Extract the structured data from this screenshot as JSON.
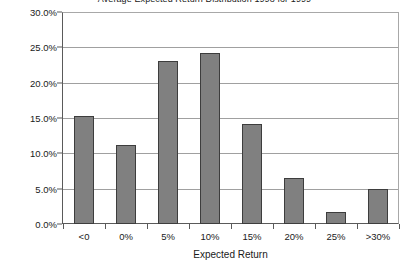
{
  "chart_data": {
    "type": "bar",
    "title": "Average Expected Return Distribution 1998 for 1999",
    "xlabel": "Expected Return",
    "ylabel": "",
    "categories": [
      "<0",
      "0%",
      "5%",
      "10%",
      "15%",
      "20%",
      "25%",
      ">30%"
    ],
    "values": [
      15.3,
      11.2,
      23.0,
      24.2,
      14.2,
      6.5,
      1.7,
      5.0
    ],
    "ylim": [
      0,
      30
    ],
    "ytick_labels": [
      "30.0%",
      "25.0%",
      "20.0%",
      "15.0%",
      "10.0%",
      "5.0%",
      "0.0%"
    ],
    "ytick_values": [
      30,
      25,
      20,
      15,
      10,
      5,
      0
    ],
    "grid": true,
    "legend": "none",
    "bar_color": "#808080",
    "bar_border_color": "#3d3d3d",
    "gridline_color": "#a0a0a0",
    "axis_color": "#5a5a5a",
    "background": "#ffffff"
  }
}
